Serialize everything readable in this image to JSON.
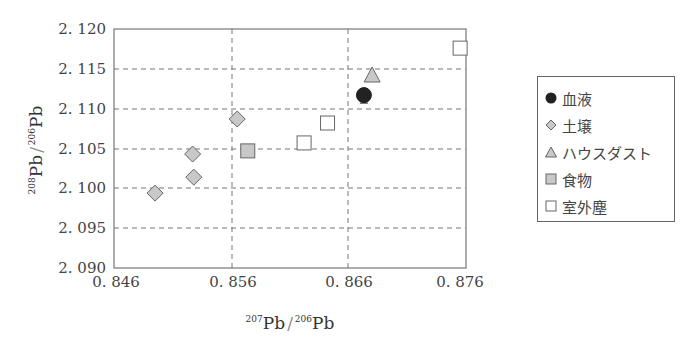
{
  "chart_data": {
    "type": "scatter",
    "title": "",
    "xlabel": "207Pb/206Pb",
    "ylabel": "208Pb/206Pb",
    "xlim": [
      0.846,
      0.876
    ],
    "ylim": [
      2.09,
      2.12
    ],
    "x_ticks": [
      "0. 846",
      "0. 856",
      "0. 866",
      "0. 876"
    ],
    "y_ticks": [
      "2. 090",
      "2. 095",
      "2. 100",
      "2. 105",
      "2. 110",
      "2. 115",
      "2. 120"
    ],
    "grid": "dashed",
    "legend_position": "right",
    "series": [
      {
        "name": "血液",
        "marker": "circle",
        "fill": "#222222",
        "points": [
          {
            "x": 0.8673,
            "y": 2.1117,
            "yerr": 0.001
          }
        ]
      },
      {
        "name": "土壌",
        "marker": "diamond",
        "fill": "#c8c8c8",
        "points": [
          {
            "x": 0.8565,
            "y": 2.1087
          },
          {
            "x": 0.8527,
            "y": 2.1043
          },
          {
            "x": 0.8528,
            "y": 2.1014
          },
          {
            "x": 0.8495,
            "y": 2.0994
          }
        ]
      },
      {
        "name": "ハウスダスト",
        "marker": "triangle",
        "fill": "#c8c8c8",
        "points": [
          {
            "x": 0.868,
            "y": 2.1141
          }
        ]
      },
      {
        "name": "食物",
        "marker": "square",
        "fill": "#c8c8c8",
        "points": [
          {
            "x": 0.8574,
            "y": 2.1047
          }
        ]
      },
      {
        "name": "室外塵",
        "marker": "open-square",
        "fill": "#ffffff",
        "points": [
          {
            "x": 0.8755,
            "y": 2.1176
          },
          {
            "x": 0.8642,
            "y": 2.1082
          },
          {
            "x": 0.8622,
            "y": 2.1057
          }
        ]
      }
    ]
  },
  "axes": {
    "x_label_sup1": "207",
    "x_label_base1": "Pb",
    "x_label_sep": "/",
    "x_label_sup2": "206",
    "x_label_base2": "Pb",
    "y_label_sup1": "208",
    "y_label_base1": "Pb",
    "y_label_sep": "/",
    "y_label_sup2": "206",
    "y_label_base2": "Pb"
  },
  "legend": {
    "items": [
      {
        "label": "血液",
        "icon": "filled-circle-icon"
      },
      {
        "label": "土壌",
        "icon": "diamond-icon"
      },
      {
        "label": "ハウスダスト",
        "icon": "triangle-icon"
      },
      {
        "label": "食物",
        "icon": "filled-square-icon"
      },
      {
        "label": "室外塵",
        "icon": "open-square-icon"
      }
    ]
  }
}
